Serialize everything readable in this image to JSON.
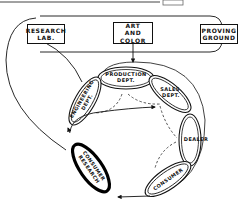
{
  "diagram": {
    "top_boxes": [
      {
        "id": "research-lab",
        "lines": [
          "RESEARCH",
          "LAB."
        ]
      },
      {
        "id": "art-and-color",
        "lines": [
          "ART",
          "AND",
          "COLOR"
        ]
      },
      {
        "id": "proving-ground",
        "lines": [
          "PROVING",
          "GROUND"
        ]
      }
    ],
    "chain_links": [
      {
        "id": "production-dept",
        "lines": [
          "PRODUCTION",
          "DEPT."
        ]
      },
      {
        "id": "sales-dept",
        "lines": [
          "SALES",
          "DEPT."
        ]
      },
      {
        "id": "dealer",
        "lines": [
          "DEALER"
        ]
      },
      {
        "id": "consumer",
        "lines": [
          "CONSUMER"
        ]
      },
      {
        "id": "consumer-research",
        "lines": [
          "CONSUMER",
          "RESEARCH"
        ],
        "emphasis": "bold-outline"
      },
      {
        "id": "engineering-dept",
        "lines": [
          "ENGINEERING",
          "DEPT."
        ]
      }
    ],
    "colors": {
      "ink": "#111111",
      "background": "#ffffff"
    }
  }
}
